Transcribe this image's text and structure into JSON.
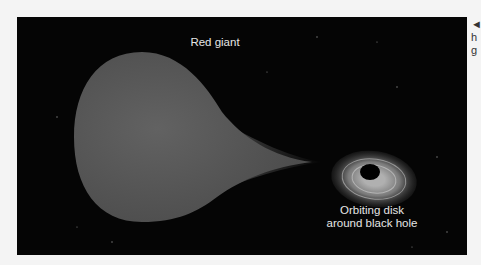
{
  "figure": {
    "labels": {
      "red_giant": "Red giant",
      "disk_line1": "Orbiting disk",
      "disk_line2": "around black hole"
    },
    "side_caption": {
      "arrow": "◄",
      "line1": "h",
      "line2": "g"
    },
    "colors": {
      "background": "#050505",
      "star": "#5a5a5a",
      "disk": "#9a9a9a"
    }
  }
}
